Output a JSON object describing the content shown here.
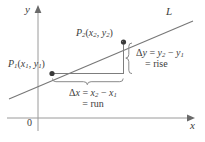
{
  "figure": {
    "axes": {
      "y_label": "y",
      "x_label": "x",
      "origin_label": "0"
    },
    "line": {
      "label": "L"
    },
    "points": {
      "p1": {
        "name": "P",
        "subscript": "1",
        "open_paren": "(",
        "x_var": "x",
        "x_sub": "1",
        "comma": ", ",
        "y_var": "y",
        "y_sub": "1",
        "close_paren": ")"
      },
      "p2": {
        "name": "P",
        "subscript": "2",
        "open_paren": "(",
        "x_var": "x",
        "x_sub": "2",
        "comma": ", ",
        "y_var": "y",
        "y_sub": "2",
        "close_paren": ")"
      }
    },
    "annotations": {
      "delta_y": {
        "delta": "Δ",
        "var": "y",
        "equals": " = ",
        "term1_var": "y",
        "term1_sub": "2",
        "minus": " − ",
        "term2_var": "y",
        "term2_sub": "1",
        "second_line": "= rise"
      },
      "delta_x": {
        "delta": "Δ",
        "var": "x",
        "equals": " = ",
        "term1_var": "x",
        "term1_sub": "2",
        "minus": " − ",
        "term2_var": "x",
        "term2_sub": "1",
        "second_line": "= run"
      }
    },
    "colors": {
      "ink": "#3c3c3c",
      "axis": "#8a8a8a",
      "line": "#6f6f6f",
      "background": "#ffffff"
    }
  }
}
